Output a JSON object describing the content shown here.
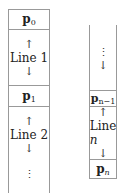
{
  "left_column": {
    "cells": [
      {
        "type": "point",
        "base": "p",
        "sub": "0"
      },
      {
        "type": "line",
        "up": "↑",
        "label": "Line 1",
        "down": "↓"
      },
      {
        "type": "point",
        "base": "p",
        "sub": "1"
      },
      {
        "type": "line",
        "up": "↑",
        "label": "Line 2",
        "down": "↓"
      },
      {
        "type": "ellipsis",
        "dots": "⋮"
      }
    ]
  },
  "right_column": {
    "cells": [
      {
        "type": "ellipsis",
        "dots": "⋮",
        "down": "↓"
      },
      {
        "type": "point",
        "base": "p",
        "sub": "n−1"
      },
      {
        "type": "line",
        "up": "↑",
        "label_prefix": "Line ",
        "label_var": "n",
        "down": "↓"
      },
      {
        "type": "point",
        "base": "p",
        "sub": "n"
      }
    ]
  }
}
